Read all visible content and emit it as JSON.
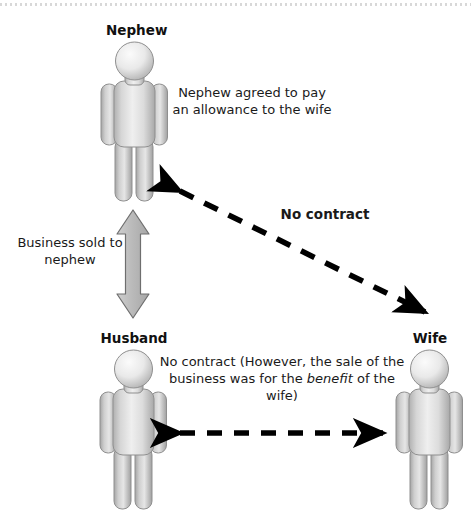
{
  "diagram": {
    "title_visible": false,
    "background_color": "#ffffff",
    "nodes": [
      {
        "id": "nephew",
        "label": "Nephew",
        "icon": "person-figure-icon"
      },
      {
        "id": "husband",
        "label": "Husband",
        "icon": "person-figure-icon"
      },
      {
        "id": "wife",
        "label": "Wife",
        "icon": "person-figure-icon"
      }
    ],
    "annotations": {
      "nephew_allowance": "Nephew agreed to pay an allowance to the wife",
      "business_sold": "Business sold to nephew"
    },
    "edges": [
      {
        "id": "nephew-wife",
        "from": "nephew",
        "to": "wife",
        "style": "dashed",
        "arrowheads": "both-ends",
        "label": "No contract",
        "label_bold": true
      },
      {
        "id": "husband-wife",
        "from": "husband",
        "to": "wife",
        "style": "dashed",
        "arrowheads": "both-ends",
        "label": "No contract",
        "label_bold": true,
        "sublabel_prefix": "(However, the sale of the business was for the ",
        "sublabel_emphasis": "benefit",
        "sublabel_suffix": " of the wife)"
      },
      {
        "id": "husband-nephew",
        "from": "husband",
        "to": "nephew",
        "style": "solid-block-arrow",
        "arrowheads": "both-ends",
        "color": "#b3b3b3",
        "label": "Business sold to nephew"
      }
    ],
    "colors": {
      "figure_fill_light": "#f2f2f2",
      "figure_fill_mid": "#c9c9c9",
      "figure_stroke": "#8c8c8c",
      "block_arrow_fill": "#b8b8b8",
      "block_arrow_stroke": "#6e6e6e",
      "dashed_arrow": "#000000",
      "text": "#1a1a1a"
    }
  }
}
